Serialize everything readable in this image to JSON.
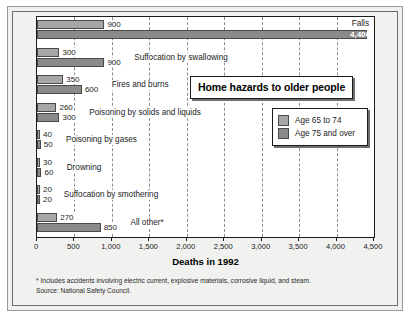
{
  "chart_data": {
    "type": "bar",
    "orientation": "horizontal",
    "title": "Home hazards to older people",
    "xlabel": "Deaths in 1992",
    "ylabel": "",
    "xlim": [
      0,
      4500
    ],
    "xticks": [
      0,
      500,
      1000,
      1500,
      2000,
      2500,
      3000,
      3500,
      4000,
      4500
    ],
    "xticklabels": [
      "0",
      "500",
      "1,000",
      "1,500",
      "2,000",
      "2,500",
      "3,000",
      "3,500",
      "4,000",
      "4,500"
    ],
    "grid": true,
    "legend_position": "center-right",
    "categories": [
      "Falls",
      "Suffocation by swallowing",
      "Fires and burns",
      "Poisoning by solids and liquids",
      "Poisoning by gases",
      "Drowning",
      "Suffocation by smothering",
      "All other*"
    ],
    "series": [
      {
        "name": "Age 65 to 74",
        "color": "#a6a6a4",
        "values": [
          900,
          300,
          350,
          260,
          40,
          30,
          20,
          270
        ],
        "value_labels": [
          "900",
          "300",
          "350",
          "260",
          "40",
          "30",
          "20",
          "270"
        ]
      },
      {
        "name": "Age 75 and over",
        "color": "#8a8a88",
        "values": [
          4400,
          900,
          600,
          300,
          50,
          60,
          20,
          850
        ],
        "value_labels": [
          "4,400",
          "900",
          "600",
          "300",
          "50",
          "60",
          "20",
          "850"
        ]
      }
    ],
    "annotations": [
      "* Includes accidents involving electric current, explosive materials, corrosive liquid, and steam.",
      "Source: National Safety Council."
    ]
  },
  "footer": {
    "note": "* Includes accidents involving electric current, explosive materials, corrosive liquid, and steam.",
    "source": "Source: National Safety Council."
  },
  "legend": {
    "items": [
      {
        "label": "Age 65 to 74",
        "color": "#a6a6a4"
      },
      {
        "label": "Age 75 and over",
        "color": "#8a8a88"
      }
    ]
  }
}
